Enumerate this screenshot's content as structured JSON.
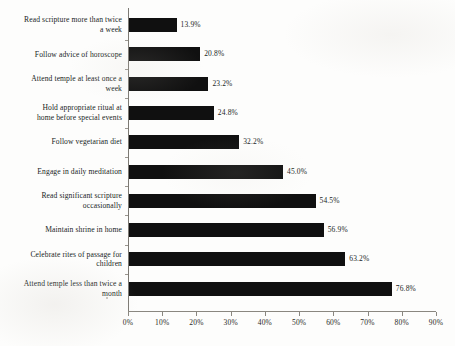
{
  "chart_data": {
    "type": "bar",
    "orientation": "horizontal",
    "title": "",
    "subtitle": "",
    "xlabel": "",
    "ylabel": "",
    "xlim": [
      0,
      90
    ],
    "grid": false,
    "legend": false,
    "legend_position": "none",
    "bar_color": "#101010",
    "axis_color": "#8a8780",
    "background_color": "#fdfdfc",
    "value_suffix": "%",
    "xticks": [
      0,
      10,
      20,
      30,
      40,
      50,
      60,
      70,
      80,
      90
    ],
    "xtick_labels": [
      "0%",
      "10%",
      "20%",
      "30%",
      "40%",
      "50%",
      "60%",
      "70%",
      "80%",
      "90%"
    ],
    "categories": [
      "Read scripture more than twice a week",
      "Follow advice of horoscope",
      "Attend temple at least once a week",
      "Hold appropriate ritual at home before special events",
      "Follow vegetarian diet",
      "Engage in daily meditation",
      "Read significant scripture occasionally",
      "Maintain shrine in home",
      "Celebrate rites of passage for children",
      "Attend temple less than twice a month"
    ],
    "values": [
      13.9,
      20.8,
      23.2,
      24.8,
      32.2,
      45.0,
      54.5,
      56.9,
      63.2,
      76.8
    ],
    "value_labels": [
      "13.9%",
      "20.8%",
      "23.2%",
      "24.8%",
      "32.2%",
      "45.0%",
      "54.5%",
      "56.9%",
      "63.2%",
      "76.8%"
    ],
    "category_lines": [
      [
        "Read scripture more than twice",
        "a week"
      ],
      [
        "Follow advice of horoscope"
      ],
      [
        "Attend temple at least once a",
        "week"
      ],
      [
        "Hold appropriate ritual at",
        "home before special events"
      ],
      [
        "Follow vegetarian diet"
      ],
      [
        "Engage in daily meditation"
      ],
      [
        "Read significant scripture",
        "occasionally"
      ],
      [
        "Maintain shrine in home"
      ],
      [
        "Celebrate rites of passage for",
        "children"
      ],
      [
        "Attend temple less than twice a",
        "month"
      ]
    ]
  }
}
